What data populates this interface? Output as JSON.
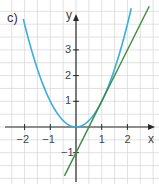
{
  "panel_label": "c)",
  "colors": {
    "grid": "#d9d9d9",
    "axis": "#2a2a2a",
    "parabola": "#3aaedc",
    "tangent": "#3b8c3b"
  },
  "chart_data": {
    "type": "line",
    "title": "",
    "xlabel": "x",
    "ylabel": "y",
    "xlim": [
      -2.9,
      3.0
    ],
    "ylim": [
      -2.0,
      4.8
    ],
    "grid": true,
    "grid_step": 0.5,
    "x_ticks": [
      -2,
      -1,
      1,
      2
    ],
    "x_tick_labels": [
      "−2",
      "−1",
      "1",
      "2"
    ],
    "y_ticks": [
      -1,
      1,
      2,
      3
    ],
    "y_tick_labels": [
      "−1",
      "1",
      "2",
      "3"
    ],
    "series": [
      {
        "name": "f(x) = x²",
        "type": "curve",
        "color": "#3aaedc",
        "x": [
          -2,
          -1.5,
          -1,
          -0.5,
          0,
          0.5,
          1,
          1.5,
          2,
          2.15
        ],
        "values": [
          4,
          2.25,
          1,
          0.25,
          0,
          0.25,
          1,
          2.25,
          4,
          4.62
        ]
      },
      {
        "name": "tangent at x=1: y = 2x − 1",
        "type": "line",
        "color": "#3b8c3b",
        "x": [
          -0.45,
          2.85
        ],
        "values": [
          -1.9,
          4.7
        ]
      }
    ]
  }
}
